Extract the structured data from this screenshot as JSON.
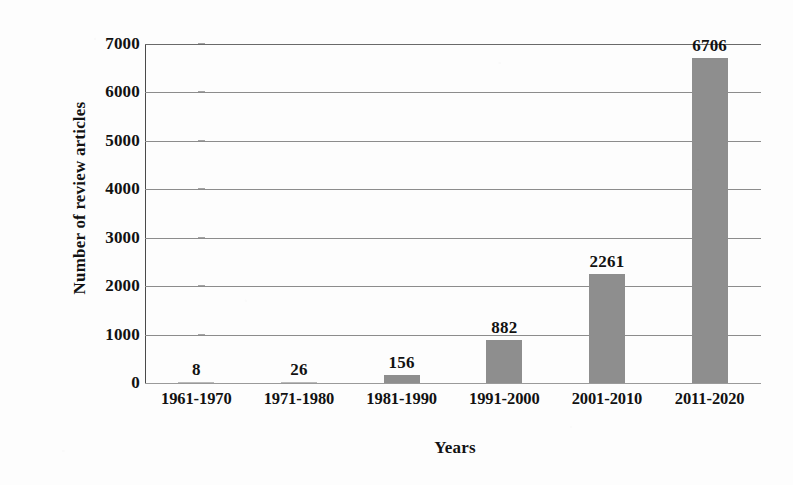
{
  "chart_data": {
    "type": "bar",
    "title": "",
    "xlabel": "Years",
    "ylabel": "Number of review articles",
    "categories": [
      "1961-1970",
      "1971-1980",
      "1981-1990",
      "1991-2000",
      "2001-2010",
      "2011-2020"
    ],
    "values": [
      8,
      26,
      156,
      882,
      2261,
      6706
    ],
    "data_labels": [
      "8",
      "26",
      "156",
      "882",
      "2261",
      "6706"
    ],
    "ylim": [
      0,
      7000
    ],
    "yticks": [
      0,
      1000,
      2000,
      3000,
      4000,
      5000,
      6000,
      7000
    ],
    "ytick_labels": [
      "0",
      "1000",
      "2000",
      "3000",
      "4000",
      "5000",
      "6000",
      "7000"
    ],
    "grid": true,
    "legend": false,
    "series": [
      {
        "name": "Number of review articles",
        "values": [
          8,
          26,
          156,
          882,
          2261,
          6706
        ]
      }
    ],
    "colors": {
      "bar_fill": "#8e8e8e",
      "gridline": "#8c8c8c",
      "axis": "#4a4a4a",
      "text": "#121212",
      "background": "#fdfdfd"
    }
  }
}
